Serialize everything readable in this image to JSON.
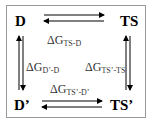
{
  "nodes": {
    "top_left": "D",
    "top_right": "TS",
    "bottom_left": "D’",
    "bottom_right": "TS’"
  },
  "labels": {
    "top": {
      "symbol": "ΔG",
      "sub": "TS-D"
    },
    "left": {
      "symbol": "ΔG",
      "sub": "D’-D"
    },
    "right": {
      "symbol": "ΔG",
      "sub": "TS’-TS"
    },
    "bottom": {
      "symbol": "ΔG",
      "sub": "TS’-D’"
    }
  },
  "edges": [
    {
      "from": "D",
      "to": "TS",
      "type": "equilibrium"
    },
    {
      "from": "D",
      "to": "D’",
      "type": "equilibrium"
    },
    {
      "from": "TS",
      "to": "TS’",
      "type": "equilibrium"
    },
    {
      "from": "D’",
      "to": "TS’",
      "type": "equilibrium"
    }
  ]
}
